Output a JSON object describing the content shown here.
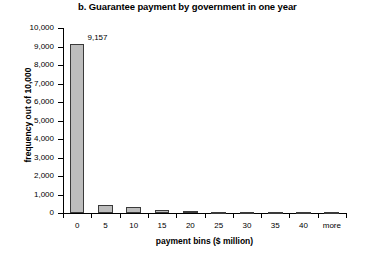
{
  "chart_data": {
    "type": "bar",
    "title": "b. Guarantee payment by government in one year",
    "xlabel": "payment bins ($ million)",
    "ylabel": "frequency out of 10,000",
    "categories": [
      "0",
      "5",
      "10",
      "15",
      "20",
      "25",
      "30",
      "35",
      "40",
      "more"
    ],
    "values": [
      9157,
      430,
      330,
      180,
      110,
      70,
      55,
      20,
      10,
      5
    ],
    "value_labels": [
      "9,157",
      "",
      "",
      "",
      "",
      "",
      "",
      "",
      "",
      ""
    ],
    "ylim": [
      0,
      10000
    ],
    "ytick_labels": [
      "0",
      "1,000",
      "2,000",
      "3,000",
      "4,000",
      "5,000",
      "6,000",
      "7,000",
      "8,000",
      "9,000",
      "10,000"
    ],
    "ytick_values": [
      0,
      1000,
      2000,
      3000,
      4000,
      5000,
      6000,
      7000,
      8000,
      9000,
      10000
    ],
    "grid": false,
    "legend": false,
    "bar_fill_color": "#bdbdbd",
    "bar_border_color": "#3a3a3a",
    "background_color": "#ffffff"
  }
}
